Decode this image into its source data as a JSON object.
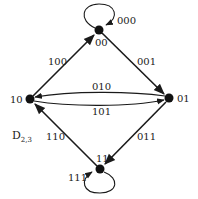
{
  "diagram": {
    "title": "D",
    "title_subscript": "2,3",
    "colors": {
      "ink": "#1a1a1a",
      "background": "#ffffff"
    },
    "nodes": [
      {
        "id": "00",
        "label": "00"
      },
      {
        "id": "01",
        "label": "01"
      },
      {
        "id": "10",
        "label": "10"
      },
      {
        "id": "11",
        "label": "11"
      }
    ],
    "edges": [
      {
        "from": "00",
        "to": "00",
        "label": "000"
      },
      {
        "from": "00",
        "to": "01",
        "label": "001"
      },
      {
        "from": "01",
        "to": "10",
        "label": "010"
      },
      {
        "from": "01",
        "to": "11",
        "label": "011"
      },
      {
        "from": "10",
        "to": "00",
        "label": "100"
      },
      {
        "from": "10",
        "to": "01",
        "label": "101"
      },
      {
        "from": "11",
        "to": "10",
        "label": "110"
      },
      {
        "from": "11",
        "to": "11",
        "label": "111"
      }
    ]
  }
}
